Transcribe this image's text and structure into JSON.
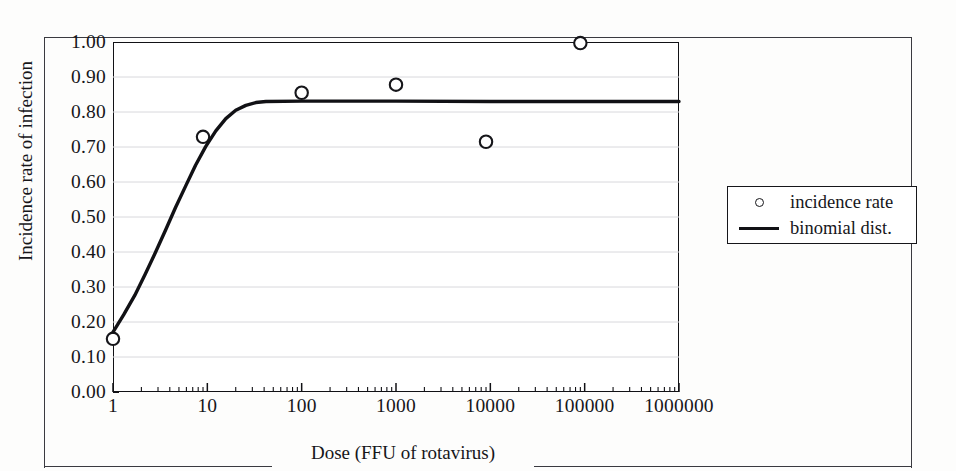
{
  "chart_data": {
    "type": "scatter",
    "title": "",
    "xlabel": "Dose (FFU of rotavirus)",
    "ylabel": "Incidence rate of infection",
    "xscale": "log",
    "xlim": [
      1,
      1000000
    ],
    "ylim": [
      0.0,
      1.0
    ],
    "grid": true,
    "legend_position": "right-outside",
    "x_tick_labels": [
      "1",
      "10",
      "100",
      "1000",
      "10000",
      "100000",
      "1000000"
    ],
    "x_tick_values": [
      1,
      10,
      100,
      1000,
      10000,
      100000,
      1000000
    ],
    "y_tick_labels": [
      "0.00",
      "0.10",
      "0.20",
      "0.30",
      "0.40",
      "0.50",
      "0.60",
      "0.70",
      "0.80",
      "0.90",
      "1.00"
    ],
    "y_tick_values": [
      0.0,
      0.1,
      0.2,
      0.3,
      0.4,
      0.5,
      0.6,
      0.7,
      0.8,
      0.9,
      1.0
    ],
    "series": [
      {
        "name": "incidence rate",
        "type": "scatter",
        "marker": "open-circle",
        "color": "#16161a",
        "points": [
          {
            "x": 1,
            "y": 0.152
          },
          {
            "x": 9,
            "y": 0.729
          },
          {
            "x": 100,
            "y": 0.855
          },
          {
            "x": 1000,
            "y": 0.878
          },
          {
            "x": 9000,
            "y": 0.715
          },
          {
            "x": 90000,
            "y": 0.997
          }
        ]
      },
      {
        "name": "binomial dist.",
        "type": "line",
        "color": "#111115",
        "points": [
          {
            "x": 1,
            "y": 0.171
          },
          {
            "x": 1.3,
            "y": 0.221
          },
          {
            "x": 1.7,
            "y": 0.276
          },
          {
            "x": 2.2,
            "y": 0.337
          },
          {
            "x": 2.8,
            "y": 0.397
          },
          {
            "x": 3.6,
            "y": 0.462
          },
          {
            "x": 4.6,
            "y": 0.527
          },
          {
            "x": 5.9,
            "y": 0.589
          },
          {
            "x": 7.5,
            "y": 0.648
          },
          {
            "x": 9.6,
            "y": 0.701
          },
          {
            "x": 12.3,
            "y": 0.746
          },
          {
            "x": 15.7,
            "y": 0.781
          },
          {
            "x": 20,
            "y": 0.805
          },
          {
            "x": 25.6,
            "y": 0.819
          },
          {
            "x": 32.7,
            "y": 0.827
          },
          {
            "x": 41.8,
            "y": 0.83
          },
          {
            "x": 100,
            "y": 0.831
          },
          {
            "x": 1000,
            "y": 0.831
          },
          {
            "x": 10000,
            "y": 0.83
          },
          {
            "x": 100000,
            "y": 0.83
          },
          {
            "x": 1000000,
            "y": 0.83
          }
        ]
      }
    ]
  },
  "legend": {
    "entries": [
      {
        "label": "incidence rate",
        "marker": "open-circle"
      },
      {
        "label": "binomial dist.",
        "marker": "solid-line"
      }
    ]
  }
}
